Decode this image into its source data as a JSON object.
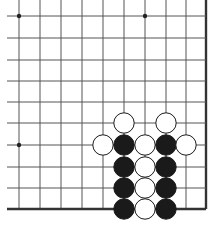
{
  "board": {
    "size_visible": {
      "cols": 10,
      "rows": 10
    },
    "col_x": [
      19,
      40,
      61,
      82,
      103,
      124,
      145,
      166,
      186,
      206
    ],
    "row_y": [
      16,
      38,
      60,
      81,
      102,
      123,
      145,
      167,
      188,
      209
    ],
    "edges": {
      "right": true,
      "bottom": true,
      "left": false,
      "top": false
    },
    "line_color": "#555555",
    "edge_color": "#333333",
    "star_points": [
      {
        "col": 0,
        "row": 0
      },
      {
        "col": 6,
        "row": 0
      },
      {
        "col": 0,
        "row": 6
      }
    ],
    "stones": [
      {
        "col": 5,
        "row": 5,
        "color": "white"
      },
      {
        "col": 7,
        "row": 5,
        "color": "white"
      },
      {
        "col": 4,
        "row": 6,
        "color": "white"
      },
      {
        "col": 5,
        "row": 6,
        "color": "black"
      },
      {
        "col": 6,
        "row": 6,
        "color": "white"
      },
      {
        "col": 7,
        "row": 6,
        "color": "black"
      },
      {
        "col": 8,
        "row": 6,
        "color": "white"
      },
      {
        "col": 5,
        "row": 7,
        "color": "black"
      },
      {
        "col": 6,
        "row": 7,
        "color": "white"
      },
      {
        "col": 7,
        "row": 7,
        "color": "black"
      },
      {
        "col": 5,
        "row": 8,
        "color": "black"
      },
      {
        "col": 6,
        "row": 8,
        "color": "white"
      },
      {
        "col": 7,
        "row": 8,
        "color": "black"
      },
      {
        "col": 5,
        "row": 9,
        "color": "black"
      },
      {
        "col": 6,
        "row": 9,
        "color": "white"
      },
      {
        "col": 7,
        "row": 9,
        "color": "black"
      }
    ]
  }
}
